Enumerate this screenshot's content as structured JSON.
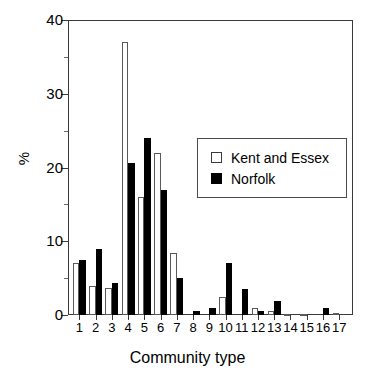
{
  "chart_data": {
    "type": "bar",
    "title": "",
    "xlabel": "Community type",
    "ylabel": "%",
    "categories": [
      "1",
      "2",
      "3",
      "4",
      "5",
      "6",
      "7",
      "8",
      "9",
      "10",
      "11",
      "12",
      "13",
      "14",
      "15",
      "16",
      "17"
    ],
    "series": [
      {
        "name": "Kent and Essex",
        "color": "#ffffff",
        "edge_color": "#5a5a5a",
        "values": [
          7.0,
          4.0,
          3.7,
          37.0,
          16.0,
          22.0,
          8.4,
          0.0,
          0.0,
          2.5,
          0.0,
          1.0,
          0.6,
          0.15,
          0.15,
          0.0,
          0.3
        ]
      },
      {
        "name": "Norfolk",
        "color": "#000000",
        "edge_color": "#000000",
        "values": [
          7.5,
          9.0,
          4.3,
          20.6,
          24.0,
          17.0,
          5.0,
          0.5,
          1.0,
          7.1,
          3.5,
          0.5,
          1.9,
          0.0,
          0.0,
          1.0,
          0.0
        ]
      }
    ],
    "ylim": [
      0,
      40
    ],
    "yticks": [
      0,
      10,
      20,
      30,
      40
    ],
    "ytick_labels": [
      "0",
      "10",
      "20",
      "30",
      "40"
    ],
    "yticks_minor": [
      5,
      15,
      25,
      35
    ],
    "grid": false,
    "legend_position": "center-right",
    "legend_entries": [
      "Kent and Essex",
      "Norfolk"
    ]
  },
  "axes": {
    "y_title": "%",
    "x_title": "Community type"
  },
  "legend": {
    "entries": [
      {
        "label": "Kent and Essex",
        "swatch": "open-square"
      },
      {
        "label": "Norfolk",
        "swatch": "filled-square"
      }
    ]
  }
}
